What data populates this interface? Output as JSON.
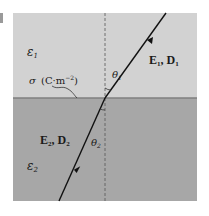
{
  "diagram": {
    "colors": {
      "background": "#ffffff",
      "upper_medium": "#d2d2d2",
      "lower_medium": "#a7a7a7",
      "interface": "#7f7f7f",
      "ray": "#111111",
      "normal": "#555555"
    },
    "regions": {
      "upper": {
        "permittivity_label": "ε",
        "permittivity_sub": "1"
      },
      "lower": {
        "permittivity_label": "ε",
        "permittivity_sub": "2"
      }
    },
    "surface_charge": {
      "symbol": "σ",
      "unit_open": "(C·m",
      "unit_exp": "−2",
      "unit_close": ")"
    },
    "fields": {
      "upper": {
        "E": "E",
        "E_sub": "1",
        "sep": ", ",
        "D": "D",
        "D_sub": "1"
      },
      "lower": {
        "E": "E",
        "E_sub": "2",
        "sep": ", ",
        "D": "D",
        "D_sub": "2"
      }
    },
    "angles": {
      "theta1": {
        "symbol": "θ",
        "sub": "1"
      },
      "theta2": {
        "symbol": "θ",
        "sub": "2"
      }
    }
  }
}
